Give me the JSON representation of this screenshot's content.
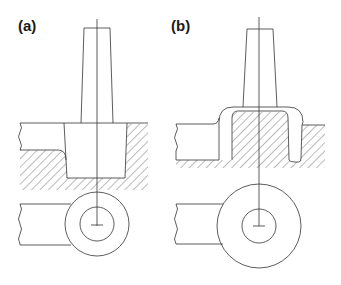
{
  "figure": {
    "panels": [
      {
        "id": "a",
        "label": "(a)",
        "description": "Punch above workpiece stock with cavity in hatched die; plan view of ring with arm below"
      },
      {
        "id": "b",
        "label": "(b)",
        "description": "Punch pressed into workpiece forming cup flange over hatched die core; plan view of larger ring with arm below"
      }
    ],
    "colors": {
      "line": "#333333",
      "hatch": "#555555",
      "background": "#ffffff"
    }
  }
}
